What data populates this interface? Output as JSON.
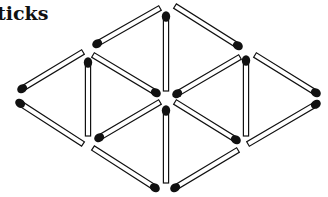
{
  "title": "ticks",
  "colors": {
    "stick_fill": "#ffffff",
    "stick_stroke": "#111111",
    "head": "#111111"
  },
  "matchsticks": [
    {
      "head": [
        95,
        45
      ],
      "tail": [
        160,
        8
      ]
    },
    {
      "head": [
        166,
        14
      ],
      "tail": [
        166,
        91
      ]
    },
    {
      "head": [
        240,
        47
      ],
      "tail": [
        175,
        6
      ]
    },
    {
      "head": [
        20,
        90
      ],
      "tail": [
        83,
        52
      ]
    },
    {
      "head": [
        88,
        60
      ],
      "tail": [
        88,
        136
      ]
    },
    {
      "head": [
        158,
        94
      ],
      "tail": [
        93,
        55
      ]
    },
    {
      "head": [
        175,
        95
      ],
      "tail": [
        240,
        57
      ]
    },
    {
      "head": [
        246,
        58
      ],
      "tail": [
        246,
        136
      ]
    },
    {
      "head": [
        318,
        94
      ],
      "tail": [
        255,
        55
      ]
    },
    {
      "head": [
        18,
        102
      ],
      "tail": [
        83,
        144
      ]
    },
    {
      "head": [
        97,
        139
      ],
      "tail": [
        160,
        102
      ]
    },
    {
      "head": [
        166,
        108
      ],
      "tail": [
        166,
        183
      ]
    },
    {
      "head": [
        238,
        141
      ],
      "tail": [
        175,
        102
      ]
    },
    {
      "head": [
        318,
        103
      ],
      "tail": [
        248,
        144
      ]
    },
    {
      "head": [
        157,
        189
      ],
      "tail": [
        93,
        148
      ]
    },
    {
      "head": [
        173,
        189
      ],
      "tail": [
        238,
        150
      ]
    }
  ]
}
